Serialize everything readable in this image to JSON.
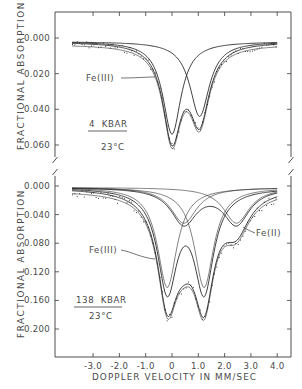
{
  "chart_data": [
    {
      "type": "line",
      "panel": "top",
      "title": "",
      "xlabel": "DOPPLER VELOCITY IN MM/SEC",
      "ylabel": "FRACTIONAL ABSORPTION",
      "xlim": [
        -4.6,
        4.5
      ],
      "ylim": [
        -0.012,
        0.072
      ],
      "yticks": [
        "0.000",
        "0.020",
        "0.040",
        "0.060"
      ],
      "ytick_values": [
        0.0,
        0.02,
        0.04,
        0.06
      ],
      "x_range_data": [
        -3.8,
        4.0
      ],
      "annotations": {
        "component_label": "Fe(III)",
        "pressure": "4  KBAR",
        "temperature": "23°C"
      },
      "baseline": 0.002,
      "components": [
        {
          "name": "Fe(III)",
          "center": 0.0,
          "depth": 0.052,
          "hwhm": 0.42
        },
        {
          "name": "second line",
          "center": 1.05,
          "depth": 0.042,
          "hwhm": 0.45
        }
      ],
      "series": [
        {
          "name": "Fe(III) component",
          "x": [
            -3.8,
            -2.0,
            -1.0,
            -0.5,
            0.0,
            0.5,
            1.0,
            2.0,
            4.0
          ],
          "y": [
            0.003,
            0.004,
            0.01,
            0.023,
            0.054,
            0.023,
            0.011,
            0.004,
            0.003
          ]
        },
        {
          "name": "second component",
          "x": [
            -3.8,
            -1.0,
            0.0,
            0.5,
            1.05,
            1.5,
            2.0,
            3.0,
            4.0
          ],
          "y": [
            0.002,
            0.003,
            0.007,
            0.018,
            0.044,
            0.02,
            0.008,
            0.004,
            0.003
          ]
        },
        {
          "name": "sum fit",
          "x": [
            -3.8,
            -2.0,
            -1.0,
            -0.5,
            0.0,
            0.5,
            1.05,
            1.5,
            2.0,
            3.0,
            4.0
          ],
          "y": [
            0.003,
            0.005,
            0.014,
            0.028,
            0.064,
            0.047,
            0.054,
            0.034,
            0.017,
            0.006,
            0.003
          ]
        }
      ]
    },
    {
      "type": "line",
      "panel": "bottom",
      "title": "",
      "xlabel": "DOPPLER VELOCITY IN MM/SEC",
      "ylabel": "FRACTIONAL ABSORPTION",
      "xlim": [
        -4.6,
        4.5
      ],
      "ylim": [
        -0.02,
        0.24
      ],
      "xticks": [
        "-3.0",
        "-2.0",
        "-1.0",
        "0",
        "1.0",
        "2.0",
        "3.0",
        "4.0"
      ],
      "xtick_values": [
        -3.0,
        -2.0,
        -1.0,
        0.0,
        1.0,
        2.0,
        3.0,
        4.0
      ],
      "yticks": [
        "0.000",
        "0.040",
        "0.080",
        "0.120",
        "0.160",
        "0.200"
      ],
      "ytick_values": [
        0.0,
        0.04,
        0.08,
        0.12,
        0.16,
        0.2
      ],
      "x_range_data": [
        -3.8,
        4.0
      ],
      "annotations": {
        "component_label_1": "Fe(III)",
        "component_label_2": "Fe(II)",
        "pressure": "138  KBAR",
        "temperature": "23°C"
      },
      "baseline": 0.002,
      "components": [
        {
          "name": "Fe(III) line 1",
          "center": -0.18,
          "depth": 0.14,
          "hwhm": 0.45
        },
        {
          "name": "Fe(III) line 2",
          "center": 1.22,
          "depth": 0.14,
          "hwhm": 0.45
        },
        {
          "name": "Fe(II) line 1",
          "center": 0.45,
          "depth": 0.05,
          "hwhm": 0.6
        },
        {
          "name": "Fe(II) line 2",
          "center": 2.45,
          "depth": 0.05,
          "hwhm": 0.6
        }
      ],
      "series": [
        {
          "name": "Fe(III) doublet",
          "x": [
            -3.8,
            -1.0,
            -0.18,
            0.5,
            1.22,
            2.0,
            4.0
          ],
          "y": [
            0.004,
            0.035,
            0.144,
            0.043,
            0.144,
            0.035,
            0.004
          ]
        },
        {
          "name": "Fe(II) doublet",
          "x": [
            -3.8,
            -1.0,
            0.45,
            1.45,
            2.45,
            3.5,
            4.0
          ],
          "y": [
            0.006,
            0.011,
            0.052,
            0.021,
            0.052,
            0.016,
            0.01
          ]
        },
        {
          "name": "sum fit",
          "x": [
            -3.8,
            -2.0,
            -1.0,
            -0.18,
            0.6,
            1.22,
            2.0,
            2.5,
            3.0,
            4.0
          ],
          "y": [
            0.01,
            0.028,
            0.06,
            0.197,
            0.158,
            0.192,
            0.095,
            0.083,
            0.05,
            0.015
          ]
        }
      ]
    }
  ]
}
